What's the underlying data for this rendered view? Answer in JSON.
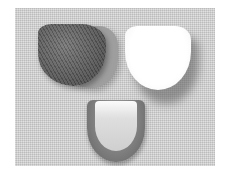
{
  "image": {
    "description": "Grayscale photo of three heel cushion pads on a textured fabric background",
    "objects": [
      {
        "name": "dark-striped-pad",
        "position": "top-left"
      },
      {
        "name": "white-pad",
        "position": "top-right"
      },
      {
        "name": "u-shaped-pad",
        "position": "bottom-center"
      }
    ],
    "colors": {
      "background": "#d2d2d2",
      "dark_pad": "#5e5e5e",
      "white_pad": "#ffffff",
      "u_pad_rim": "#7a7a7a"
    }
  }
}
